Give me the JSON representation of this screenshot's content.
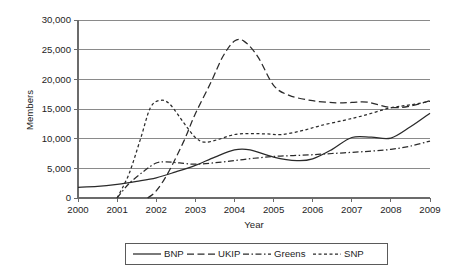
{
  "chart_data": {
    "type": "line",
    "title": "",
    "xlabel": "Year",
    "ylabel": "Members",
    "xlim": [
      2000,
      2009
    ],
    "ylim": [
      0,
      30000
    ],
    "grid": true,
    "legend_position": "bottom",
    "x_tick_labels": [
      "2000",
      "2001",
      "2002",
      "2003",
      "2004",
      "2005",
      "2006",
      "2007",
      "2008",
      "2009"
    ],
    "y_tick_labels": [
      "0",
      "5,000",
      "10,000",
      "15,000",
      "20,000",
      "25,000",
      "30,000"
    ],
    "y_tick_values": [
      0,
      5000,
      10000,
      15000,
      20000,
      25000,
      30000
    ],
    "x": [
      2000,
      2001,
      2002,
      2003,
      2004,
      2005,
      2006,
      2007,
      2008,
      2009
    ],
    "series": [
      {
        "name": "BNP",
        "line_style": "solid",
        "values": [
          1800,
          2300,
          3400,
          5500,
          8100,
          6800,
          6600,
          10200,
          10100,
          14300
        ],
        "points": [
          [
            2000.0,
            1800
          ],
          [
            2000.5,
            1950
          ],
          [
            2001.0,
            2300
          ],
          [
            2001.5,
            2800
          ],
          [
            2002.0,
            3400
          ],
          [
            2002.5,
            4400
          ],
          [
            2003.0,
            5500
          ],
          [
            2003.5,
            6900
          ],
          [
            2004.0,
            8100
          ],
          [
            2004.4,
            8100
          ],
          [
            2005.0,
            6900
          ],
          [
            2005.6,
            6300
          ],
          [
            2006.0,
            6600
          ],
          [
            2006.5,
            8200
          ],
          [
            2007.0,
            10200
          ],
          [
            2007.5,
            10250
          ],
          [
            2008.0,
            10100
          ],
          [
            2008.5,
            12000
          ],
          [
            2009.0,
            14300
          ]
        ]
      },
      {
        "name": "UKIP",
        "line_style": "dashed",
        "values": [
          null,
          null,
          1200,
          9000,
          26500,
          19000,
          16400,
          16100,
          15200,
          16400
        ],
        "points": [
          [
            2001.78,
            0
          ],
          [
            2002.0,
            1200
          ],
          [
            2002.3,
            4200
          ],
          [
            2002.7,
            9500
          ],
          [
            2003.0,
            14200
          ],
          [
            2003.4,
            19500
          ],
          [
            2003.7,
            23800
          ],
          [
            2004.0,
            26450
          ],
          [
            2004.25,
            26400
          ],
          [
            2004.6,
            23800
          ],
          [
            2005.0,
            19000
          ],
          [
            2005.4,
            17300
          ],
          [
            2006.0,
            16400
          ],
          [
            2006.6,
            16050
          ],
          [
            2007.0,
            16100
          ],
          [
            2007.4,
            16150
          ],
          [
            2008.0,
            15250
          ],
          [
            2008.5,
            15500
          ],
          [
            2009.0,
            16400
          ]
        ]
      },
      {
        "name": "Greens",
        "line_style": "dash-dot",
        "values": [
          null,
          0,
          6050,
          5700,
          6300,
          7000,
          7300,
          7700,
          8200,
          9600
        ],
        "points": [
          [
            2001.0,
            0
          ],
          [
            2001.3,
            2400
          ],
          [
            2001.7,
            4600
          ],
          [
            2002.0,
            5900
          ],
          [
            2002.25,
            6100
          ],
          [
            2002.6,
            5900
          ],
          [
            2003.0,
            5700
          ],
          [
            2003.5,
            5950
          ],
          [
            2004.0,
            6300
          ],
          [
            2004.5,
            6700
          ],
          [
            2005.0,
            7000
          ],
          [
            2005.5,
            7150
          ],
          [
            2006.0,
            7300
          ],
          [
            2006.5,
            7500
          ],
          [
            2007.0,
            7700
          ],
          [
            2007.5,
            7900
          ],
          [
            2008.0,
            8200
          ],
          [
            2008.5,
            8750
          ],
          [
            2009.0,
            9600
          ]
        ]
      },
      {
        "name": "SNP",
        "line_style": "dotted",
        "values": [
          null,
          0,
          16400,
          9500,
          10800,
          10700,
          11800,
          13200,
          15200,
          16300
        ],
        "points": [
          [
            2001.0,
            0
          ],
          [
            2001.3,
            4000
          ],
          [
            2001.6,
            10000
          ],
          [
            2001.85,
            15200
          ],
          [
            2002.1,
            16450
          ],
          [
            2002.35,
            15800
          ],
          [
            2002.7,
            12700
          ],
          [
            2003.0,
            10200
          ],
          [
            2003.25,
            9400
          ],
          [
            2003.6,
            9900
          ],
          [
            2004.0,
            10700
          ],
          [
            2004.4,
            10850
          ],
          [
            2004.8,
            10800
          ],
          [
            2005.2,
            10700
          ],
          [
            2005.7,
            11300
          ],
          [
            2006.2,
            12200
          ],
          [
            2006.8,
            13100
          ],
          [
            2007.3,
            13900
          ],
          [
            2008.0,
            15200
          ],
          [
            2008.5,
            15700
          ],
          [
            2009.0,
            16300
          ]
        ]
      }
    ],
    "legend_entries": [
      {
        "label": "BNP",
        "line_style": "solid"
      },
      {
        "label": "UKIP",
        "line_style": "dashed"
      },
      {
        "label": "Greens",
        "line_style": "dash-dot"
      },
      {
        "label": "SNP",
        "line_style": "dotted"
      }
    ],
    "colors": {
      "line": "#2a2a2a",
      "grid": "#8a8a8a",
      "axis": "#6b6b6b",
      "text": "#1d1d1d",
      "background": "#ffffff"
    }
  }
}
